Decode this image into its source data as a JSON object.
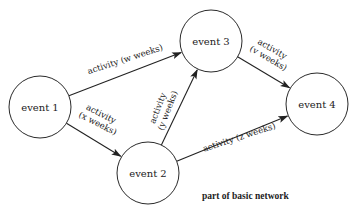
{
  "diagram": {
    "type": "activity-network",
    "caption": "part of basic network",
    "colors": {
      "stroke": "#222222",
      "background": "#ffffff",
      "text": "#222222"
    },
    "nodes": [
      {
        "id": "e1",
        "label": "event 1",
        "cx": 40,
        "cy": 107,
        "r": 31
      },
      {
        "id": "e2",
        "label": "event 2",
        "cx": 148,
        "cy": 173,
        "r": 31
      },
      {
        "id": "e3",
        "label": "event 3",
        "cx": 211,
        "cy": 41,
        "r": 31
      },
      {
        "id": "e4",
        "label": "event 4",
        "cx": 317,
        "cy": 104,
        "r": 31
      }
    ],
    "edges": [
      {
        "from": "e1",
        "to": "e3",
        "label_lines": [
          "activity (w weeks)"
        ]
      },
      {
        "from": "e1",
        "to": "e2",
        "label_lines": [
          "activity",
          "(x weeks)"
        ]
      },
      {
        "from": "e2",
        "to": "e3",
        "label_lines": [
          "activity",
          "(y weeks)"
        ]
      },
      {
        "from": "e3",
        "to": "e4",
        "label_lines": [
          "activity",
          "(v weeks)"
        ]
      },
      {
        "from": "e2",
        "to": "e4",
        "label_lines": [
          "activity (z weeks)"
        ]
      }
    ]
  }
}
